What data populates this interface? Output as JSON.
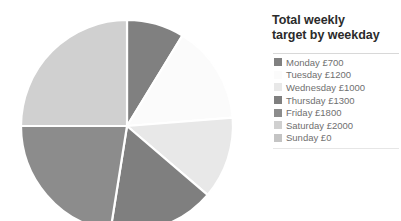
{
  "legend": {
    "title": "Total weekly target by weekday",
    "title_line_1": "Total weekly",
    "title_line_2": "target by weekday",
    "items": [
      {
        "label": "Monday £700",
        "color": "#808080"
      },
      {
        "label": "Tuesday £1200",
        "color": "#fbfbfb"
      },
      {
        "label": "Wednesday £1000",
        "color": "#e8e8e8"
      },
      {
        "label": "Thursday £1300",
        "color": "#7f7f7f"
      },
      {
        "label": "Friday £1800",
        "color": "#8c8c8c"
      },
      {
        "label": "Saturday £2000",
        "color": "#d0d0d0"
      },
      {
        "label": "Sunday £0",
        "color": "#c4c4c4"
      }
    ]
  },
  "chart_data": {
    "type": "pie",
    "title": "Total weekly target by weekday",
    "unit": "£",
    "total": 8000,
    "start_angle": 0,
    "direction": "clockwise",
    "separator_color": "#ffffff",
    "categories": [
      "Monday",
      "Tuesday",
      "Wednesday",
      "Thursday",
      "Friday",
      "Saturday",
      "Sunday"
    ],
    "values": [
      700,
      1200,
      1000,
      1300,
      1800,
      2000,
      0
    ],
    "labels": [
      "Monday £700",
      "Tuesday £1200",
      "Wednesday £1000",
      "Thursday £1300",
      "Friday £1800",
      "Saturday £2000",
      "Sunday £0"
    ],
    "colors": [
      "#808080",
      "#fbfbfb",
      "#e8e8e8",
      "#7f7f7f",
      "#8c8c8c",
      "#d0d0d0",
      "#c4c4c4"
    ],
    "percentages": [
      8.75,
      15.0,
      12.5,
      16.25,
      22.5,
      25.0,
      0
    ],
    "legend_position": "right",
    "grid": false,
    "geometry": {
      "cx": 127,
      "cy": 126,
      "r": 106
    }
  }
}
